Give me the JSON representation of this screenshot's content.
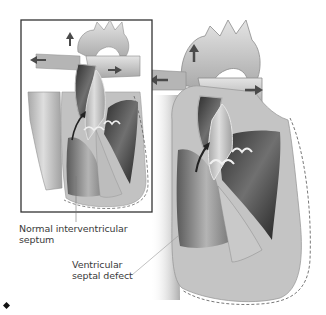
{
  "figure": {
    "inset": {
      "description": "Normal heart cross-section in framed inset",
      "frame_color": "#333333"
    },
    "main": {
      "description": "Heart cross-section with ventricular septal defect"
    },
    "colors": {
      "tissue_light": "#c8c8c8",
      "tissue_mid": "#9a9a9a",
      "tissue_dark": "#3c3c3c",
      "arrow": "#4a4a4a",
      "outline_dashed": "#555555",
      "background": "#ffffff"
    }
  },
  "labels": {
    "normal_septum": {
      "line1": "Normal interventricular",
      "line2": "septum"
    },
    "vsd": {
      "line1": "Ventricular",
      "line2": "septal defect"
    }
  },
  "bullet": {
    "icon": "diamond-bullet-icon",
    "glyph": "◆"
  }
}
